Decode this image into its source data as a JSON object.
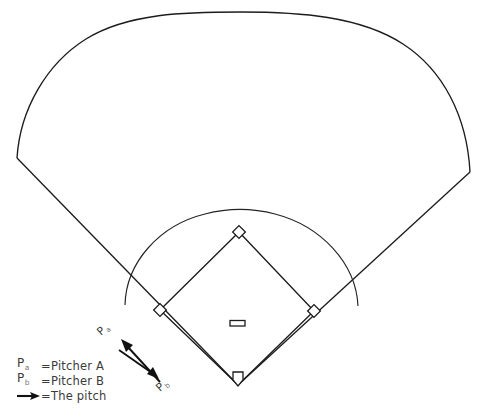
{
  "diagram": {
    "background_color": "#ffffff",
    "line_color": "#1c1c1c",
    "field": {
      "outfield_fence_name": "outfield-fence",
      "left_foul_line_name": "left-foul-line",
      "right_foul_line_name": "right-foul-line",
      "infield_arc_name": "infield-grass-arc"
    },
    "bases": [
      {
        "id": "home-plate",
        "label": "Home plate"
      },
      {
        "id": "first-base",
        "label": "First base"
      },
      {
        "id": "second-base",
        "label": "Second base"
      },
      {
        "id": "third-base",
        "label": "Third base"
      }
    ],
    "pitchers_rubber": {
      "id": "pitchers-rubber",
      "label": "Pitcher's rubber"
    },
    "markers": [
      {
        "id": "marker-pitcher-a",
        "letter": "P",
        "subscript": "a"
      },
      {
        "id": "marker-pitcher-b",
        "letter": "P",
        "subscript": "b"
      }
    ],
    "pitch_arrows": [
      {
        "id": "pitch-arrow-to-a",
        "direction": "up-left"
      },
      {
        "id": "pitch-arrow-to-b",
        "direction": "down-right"
      }
    ]
  },
  "legend": {
    "rows": [
      {
        "key_letter": "P",
        "key_sub": "a",
        "equals": "=",
        "label": "Pitcher A",
        "icon": "none"
      },
      {
        "key_letter": "P",
        "key_sub": "b",
        "equals": "=",
        "label": "Pitcher B",
        "icon": "none"
      },
      {
        "key_letter": "",
        "key_sub": "",
        "equals": "=",
        "label": "The pitch",
        "icon": "arrow-right-icon"
      }
    ]
  }
}
